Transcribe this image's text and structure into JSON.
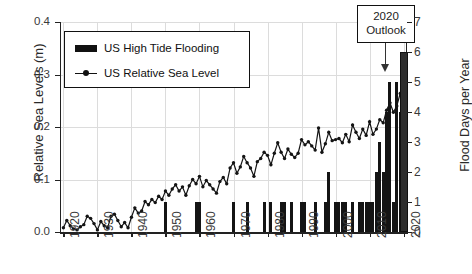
{
  "chart_data": {
    "type": "bar",
    "title": "",
    "xlabel": "",
    "ylabel": "Relative Sea Levels (m)",
    "ylabel_right": "Flood Days per Year",
    "xlim": [
      1919,
      2021
    ],
    "ylim": [
      0,
      0.4
    ],
    "ylim_right": [
      0,
      7
    ],
    "grid": true,
    "legend_position": "upper left",
    "x_tick_labels": [
      "1920",
      "1930",
      "1940",
      "1950",
      "1960",
      "1970",
      "1980",
      "1990",
      "2000",
      "2010",
      "2020"
    ],
    "y_tick_labels_left": [
      "0.0",
      "0.1",
      "0.2",
      "0.3",
      "0.4"
    ],
    "y_tick_labels_right": [
      "0",
      "1",
      "2",
      "3",
      "4",
      "5",
      "6",
      "7"
    ],
    "annotations": [
      {
        "text_line1": "2020",
        "text_line2": "Outlook",
        "points_to_year": 2020,
        "points_to_value": 6
      }
    ],
    "series": [
      {
        "name": "US High Tide Flooding",
        "type": "bar",
        "axis": "right",
        "units": "flood days per year",
        "x": [
          1920,
          1921,
          1922,
          1923,
          1924,
          1925,
          1926,
          1927,
          1928,
          1929,
          1930,
          1931,
          1932,
          1933,
          1934,
          1935,
          1936,
          1937,
          1938,
          1939,
          1940,
          1941,
          1942,
          1943,
          1944,
          1945,
          1946,
          1947,
          1948,
          1949,
          1950,
          1951,
          1952,
          1953,
          1954,
          1955,
          1956,
          1957,
          1958,
          1959,
          1960,
          1961,
          1962,
          1963,
          1964,
          1965,
          1966,
          1967,
          1968,
          1969,
          1970,
          1971,
          1972,
          1973,
          1974,
          1975,
          1976,
          1977,
          1978,
          1979,
          1980,
          1981,
          1982,
          1983,
          1984,
          1985,
          1986,
          1987,
          1988,
          1989,
          1990,
          1991,
          1992,
          1993,
          1994,
          1995,
          1996,
          1997,
          1998,
          1999,
          2000,
          2001,
          2002,
          2003,
          2004,
          2005,
          2006,
          2007,
          2008,
          2009,
          2010,
          2011,
          2012,
          2013,
          2014,
          2015,
          2016,
          2017,
          2018,
          2019
        ],
        "values": [
          0,
          0,
          0,
          0,
          0,
          0,
          0,
          0,
          0,
          0,
          0,
          0,
          0,
          0,
          0,
          0,
          0,
          0,
          0,
          0,
          0,
          0,
          0,
          0,
          0,
          0,
          0,
          0,
          0,
          0,
          1,
          0,
          0,
          0,
          0,
          0,
          0,
          0,
          0,
          1,
          1,
          0,
          0,
          0,
          0,
          0,
          0,
          0,
          0,
          0,
          1,
          0,
          0,
          0,
          1,
          0,
          0,
          0,
          0,
          1,
          0,
          1,
          0,
          0,
          1,
          1,
          0,
          1,
          0,
          0,
          1,
          1,
          0,
          0,
          1,
          0,
          0,
          1,
          2,
          0,
          1,
          1,
          1,
          1,
          0,
          1,
          0,
          1,
          1,
          1,
          1,
          1,
          2,
          3,
          2,
          4,
          5,
          1,
          5,
          4
        ]
      },
      {
        "name": "US High Tide Flooding 2020 Outlook",
        "type": "bar-outlined",
        "axis": "right",
        "x": [
          2020
        ],
        "values": [
          6
        ]
      },
      {
        "name": "US Relative Sea Level",
        "type": "line",
        "axis": "left",
        "units": "m",
        "x": [
          1920,
          1921,
          1922,
          1923,
          1924,
          1925,
          1926,
          1927,
          1928,
          1929,
          1930,
          1931,
          1932,
          1933,
          1934,
          1935,
          1936,
          1937,
          1938,
          1939,
          1940,
          1941,
          1942,
          1943,
          1944,
          1945,
          1946,
          1947,
          1948,
          1949,
          1950,
          1951,
          1952,
          1953,
          1954,
          1955,
          1956,
          1957,
          1958,
          1959,
          1960,
          1961,
          1962,
          1963,
          1964,
          1965,
          1966,
          1967,
          1968,
          1969,
          1970,
          1971,
          1972,
          1973,
          1974,
          1975,
          1976,
          1977,
          1978,
          1979,
          1980,
          1981,
          1982,
          1983,
          1984,
          1985,
          1986,
          1987,
          1988,
          1989,
          1990,
          1991,
          1992,
          1993,
          1994,
          1995,
          1996,
          1997,
          1998,
          1999,
          2000,
          2001,
          2002,
          2003,
          2004,
          2005,
          2006,
          2007,
          2008,
          2009,
          2010,
          2011,
          2012,
          2013,
          2014,
          2015,
          2016,
          2017,
          2018,
          2019,
          2020
        ],
        "values": [
          0.008,
          0.022,
          0.012,
          0.006,
          0.004,
          0.01,
          0.014,
          0.03,
          0.026,
          0.016,
          0.004,
          0.02,
          0.012,
          0.008,
          0.03,
          0.034,
          0.022,
          0.01,
          0.018,
          0.008,
          0.028,
          0.046,
          0.036,
          0.04,
          0.058,
          0.052,
          0.062,
          0.056,
          0.068,
          0.062,
          0.078,
          0.07,
          0.082,
          0.09,
          0.078,
          0.086,
          0.07,
          0.088,
          0.1,
          0.092,
          0.106,
          0.086,
          0.098,
          0.09,
          0.082,
          0.074,
          0.096,
          0.104,
          0.092,
          0.122,
          0.132,
          0.112,
          0.124,
          0.144,
          0.132,
          0.122,
          0.106,
          0.134,
          0.14,
          0.152,
          0.146,
          0.128,
          0.15,
          0.17,
          0.152,
          0.14,
          0.158,
          0.148,
          0.142,
          0.15,
          0.176,
          0.166,
          0.172,
          0.164,
          0.156,
          0.198,
          0.152,
          0.168,
          0.19,
          0.174,
          0.176,
          0.178,
          0.17,
          0.186,
          0.172,
          0.204,
          0.19,
          0.178,
          0.196,
          0.184,
          0.21,
          0.186,
          0.196,
          0.214,
          0.208,
          0.232,
          0.246,
          0.228,
          0.24,
          0.264,
          0.302
        ]
      }
    ]
  }
}
